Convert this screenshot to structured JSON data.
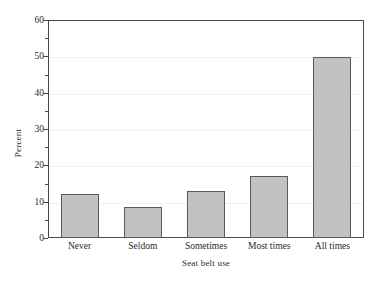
{
  "chart_data": {
    "type": "bar",
    "title": "",
    "xlabel": "Seat belt use",
    "ylabel": "Percent",
    "categories": [
      "Never",
      "Seldom",
      "Sometimes",
      "Most times",
      "All times"
    ],
    "values": [
      12.0,
      8.5,
      13.0,
      17.0,
      49.8
    ],
    "ylim": [
      0,
      60
    ],
    "y_major_ticks": [
      0,
      10,
      20,
      30,
      40,
      50,
      60
    ],
    "y_minor_ticks": [
      5,
      15,
      25,
      35,
      45,
      55
    ],
    "y_tick_labels": [
      "0",
      "10",
      "20",
      "30",
      "40",
      "50",
      "60"
    ],
    "grid": "horizontal-faint",
    "legend": "none",
    "bar_fill_color": "#c2c2c2",
    "bar_border_color": "#5a5a5a",
    "axis_color": "#4a4a4a",
    "background_color": "#ffffff"
  }
}
